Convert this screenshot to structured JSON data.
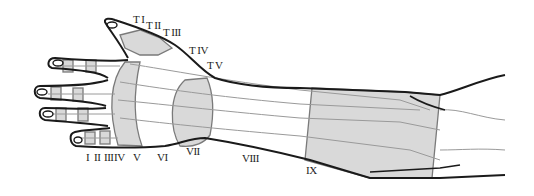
{
  "diagram": {
    "colors": {
      "outline": "#1a1a1a",
      "zone_fill": "#d9d9d9",
      "zone_border": "#7a7a7a",
      "tendon": "#9a9a9a"
    },
    "thumb_zone_labels": [
      {
        "text": "T I",
        "x": 133,
        "y": 14
      },
      {
        "text": "T II",
        "x": 146,
        "y": 20
      },
      {
        "text": "T III",
        "x": 163,
        "y": 27
      },
      {
        "text": "T IV",
        "x": 189,
        "y": 45
      },
      {
        "text": "T V",
        "x": 207,
        "y": 60
      }
    ],
    "finger_zone_labels": [
      {
        "text": "I",
        "x": 86,
        "y": 152
      },
      {
        "text": "II",
        "x": 94,
        "y": 152
      },
      {
        "text": "III",
        "x": 104,
        "y": 152
      },
      {
        "text": "IV",
        "x": 114,
        "y": 152
      },
      {
        "text": "V",
        "x": 133,
        "y": 152
      },
      {
        "text": "VI",
        "x": 157,
        "y": 152
      },
      {
        "text": "VII",
        "x": 186,
        "y": 146
      },
      {
        "text": "VIII",
        "x": 242,
        "y": 153
      },
      {
        "text": "IX",
        "x": 306,
        "y": 165
      }
    ]
  }
}
